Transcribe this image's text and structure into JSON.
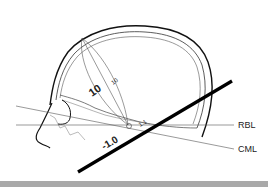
{
  "diagram": {
    "labels": {
      "rbl": "RBL",
      "cml": "CML",
      "distance_large": "10",
      "distance_small": "10",
      "ratio_near": "1.1",
      "ratio_neg": "-1.0"
    },
    "colors": {
      "line": "#111111",
      "thin_line": "#555555",
      "footer": "#a9a9a9",
      "background": "#ffffff"
    }
  }
}
